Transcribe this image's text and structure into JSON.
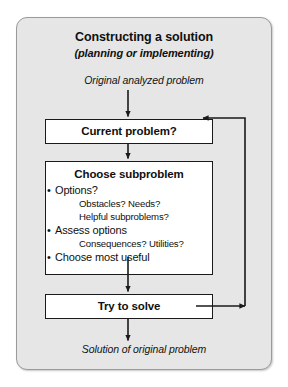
{
  "panel": {
    "title": "Constructing a solution",
    "subtitle": "(planning or implementing)",
    "bg_color": "#e6e6e6",
    "border_color": "#9a9a9a"
  },
  "captions": {
    "input": "Original analyzed problem",
    "output": "Solution of original problem"
  },
  "nodes": {
    "current_problem": {
      "label": "Current problem?"
    },
    "choose_subproblem": {
      "heading": "Choose subproblem",
      "items": [
        {
          "type": "bullet",
          "text": "Options?"
        },
        {
          "type": "sub",
          "text": "Obstacles? Needs?"
        },
        {
          "type": "sub",
          "text": "Helpful subproblems?"
        },
        {
          "type": "bullet",
          "text": "Assess options"
        },
        {
          "type": "sub",
          "text": "Consequences? Utilities?"
        },
        {
          "type": "bullet",
          "text": "Choose most useful"
        }
      ]
    },
    "try_to_solve": {
      "label": "Try to solve"
    }
  },
  "edges": [
    {
      "name": "input-to-current",
      "from": "input-caption",
      "to": "current_problem",
      "style": "arrow-down"
    },
    {
      "name": "current-to-choose",
      "from": "current_problem",
      "to": "choose_subproblem",
      "style": "arrow-down"
    },
    {
      "name": "choose-to-try",
      "from": "choose_subproblem",
      "to": "try_to_solve",
      "style": "arrow-down"
    },
    {
      "name": "try-to-output",
      "from": "try_to_solve",
      "to": "output-caption",
      "style": "arrow-down"
    },
    {
      "name": "feedback-loop",
      "from": "try_to_solve",
      "to": "current_problem",
      "style": "arrow-right-up-left"
    }
  ],
  "colors": {
    "box_fill": "#ffffff",
    "box_border": "#1a1a1a",
    "line": "#1a1a1a",
    "text": "#101010"
  }
}
